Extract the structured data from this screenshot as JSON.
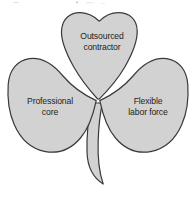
{
  "diagram": {
    "name": "shamrock-organization",
    "type": "three-lobe-clover",
    "background_color": "#ffffff",
    "lobe_fill_color": "#d2d2d2",
    "lobe_stroke_color": "#3a3a3a",
    "label_color": "#231f20",
    "lobes": [
      {
        "id": "top",
        "name": "outsourced-contractor",
        "line1": "Outsourced",
        "line2": "contractor"
      },
      {
        "id": "left",
        "name": "professional-core",
        "line1": "Professional",
        "line2": "core"
      },
      {
        "id": "right",
        "name": "flexible-labor-force",
        "line1": "Flexible",
        "line2": "labor force"
      }
    ],
    "stem": {
      "name": "clover-stem",
      "visible": true
    }
  }
}
